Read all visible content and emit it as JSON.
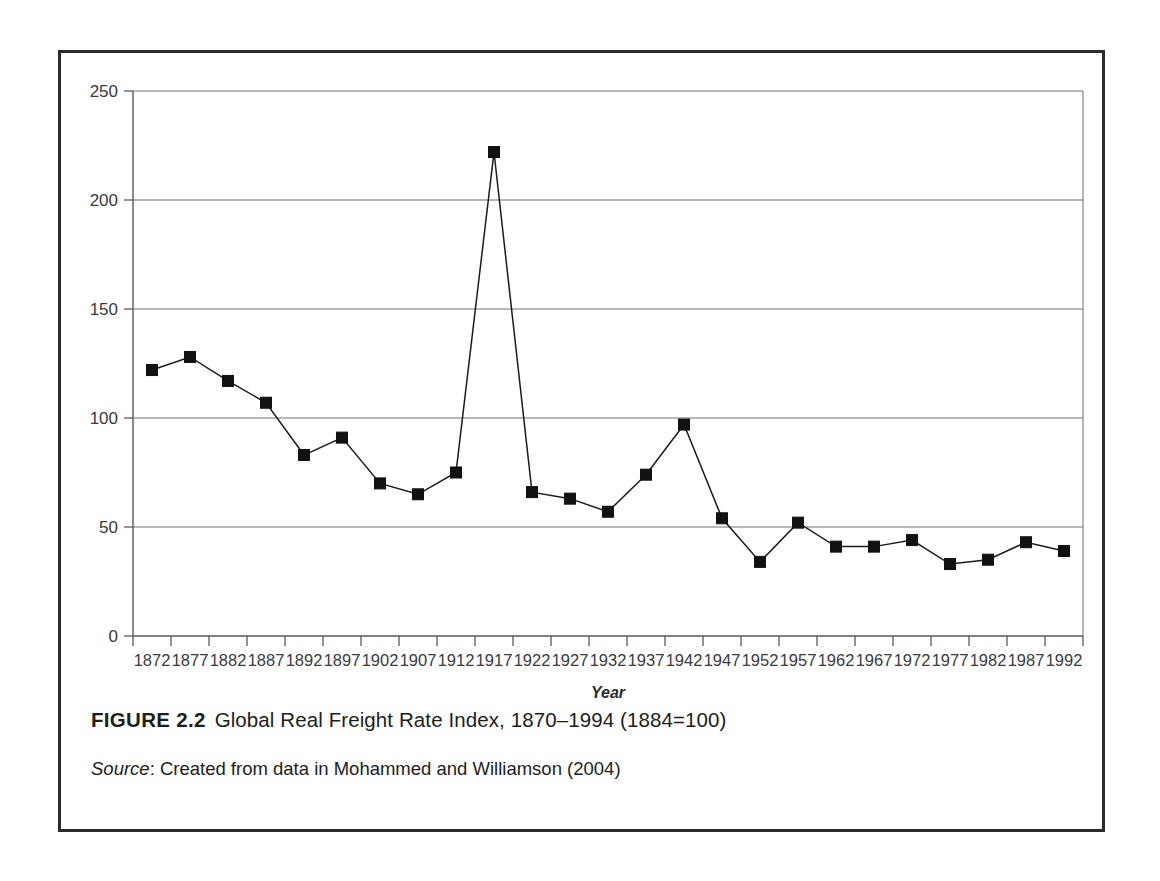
{
  "figure": {
    "label": "FIGURE 2.2",
    "title": "Global Real Freight Rate Index, 1870–1994 (1884=100)",
    "source_label": "Source",
    "source_separator": ": ",
    "source_text": "Created from data in Mohammed and Williamson (2004)"
  },
  "chart_data": {
    "type": "line",
    "title": "Global Real Freight Rate Index, 1870–1994 (1884=100)",
    "xlabel": "Year",
    "ylabel": "",
    "xlim": [
      1870,
      1994
    ],
    "ylim": [
      0,
      250
    ],
    "ytick_step": 50,
    "yticks": [
      0,
      50,
      100,
      150,
      200,
      250
    ],
    "ytick_labels": [
      "0",
      "50",
      "100",
      "150",
      "200",
      "250"
    ],
    "grid": "horizontal",
    "legend": "none",
    "marker": "square",
    "line_color": "#1a1a1a",
    "marker_color": "#111111",
    "categories": [
      1872,
      1877,
      1882,
      1887,
      1892,
      1897,
      1902,
      1907,
      1912,
      1917,
      1922,
      1927,
      1932,
      1937,
      1942,
      1947,
      1952,
      1957,
      1962,
      1967,
      1972,
      1977,
      1982,
      1987,
      1992
    ],
    "xtick_labels": [
      "1872",
      "1877",
      "1882",
      "1887",
      "1892",
      "1897",
      "1902",
      "1907",
      "1912",
      "1917",
      "1922",
      "1927",
      "1932",
      "1937",
      "1942",
      "1947",
      "1952",
      "1957",
      "1962",
      "1967",
      "1972",
      "1977",
      "1982",
      "1987",
      "1992"
    ],
    "values": [
      122,
      128,
      117,
      107,
      83,
      91,
      70,
      65,
      75,
      222,
      66,
      63,
      57,
      74,
      97,
      54,
      34,
      52,
      41,
      41,
      44,
      33,
      35,
      43,
      39
    ],
    "series": [
      {
        "name": "Global Real Freight Rate Index",
        "values": [
          122,
          128,
          117,
          107,
          83,
          91,
          70,
          65,
          75,
          222,
          66,
          63,
          57,
          74,
          97,
          54,
          34,
          52,
          41,
          41,
          44,
          33,
          35,
          43,
          39
        ]
      }
    ],
    "annotations": [
      {
        "x": 1917,
        "y": 222,
        "note": "peak"
      }
    ]
  }
}
